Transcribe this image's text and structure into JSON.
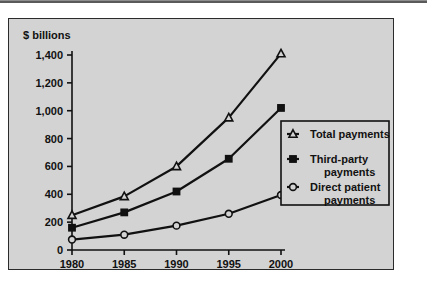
{
  "figure": {
    "background_color": "#d3d3d3",
    "border_color": "#2b2b2b",
    "ink_color": "#111111"
  },
  "chart_data": {
    "type": "line",
    "title": "",
    "subtitle": "",
    "xlabel": "",
    "ylabel": "$ billions",
    "categories": [
      "1980",
      "1985",
      "1990",
      "1995",
      "2000"
    ],
    "x": [
      1980,
      1985,
      1990,
      1995,
      2000
    ],
    "xlim": [
      1980,
      2000
    ],
    "ylim": [
      0,
      1400
    ],
    "ytick_labels": [
      "0",
      "200",
      "400",
      "600",
      "800",
      "1,000",
      "1,200",
      "1,400"
    ],
    "ytick_values": [
      0,
      200,
      400,
      600,
      800,
      1000,
      1200,
      1400
    ],
    "xtick_labels": [
      "1980",
      "1985",
      "1990",
      "1995",
      "2000"
    ],
    "grid": false,
    "legend_position": "right-center",
    "series": [
      {
        "name": "Total payments",
        "marker": "open-triangle",
        "values": [
          250,
          385,
          600,
          950,
          1410
        ]
      },
      {
        "name": "Third-party payments",
        "marker": "filled-square",
        "values": [
          160,
          270,
          420,
          655,
          1020
        ]
      },
      {
        "name": "Direct patient payments",
        "marker": "open-circle",
        "values": [
          75,
          110,
          175,
          260,
          395
        ]
      }
    ]
  },
  "legend": {
    "entries": [
      {
        "label_line1": "Total payments",
        "label_line2": ""
      },
      {
        "label_line1": "Third-party",
        "label_line2": "payments"
      },
      {
        "label_line1": "Direct patient",
        "label_line2": "payments"
      }
    ]
  }
}
